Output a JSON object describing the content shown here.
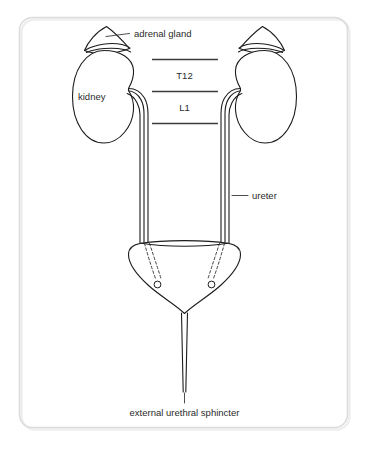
{
  "figure": {
    "background_color": "#ffffff",
    "frame_color": "#dcdcdc",
    "stroke_color": "#1c1c1c",
    "text_color": "#2b2b2b"
  },
  "labels": {
    "adrenal_gland": "adrenal gland",
    "kidney": "kidney",
    "ureter": "ureter",
    "external_urethral_sphincter": "external urethral sphincter",
    "vertebra_t12": "T12",
    "vertebra_l1": "L1"
  },
  "structures": [
    {
      "name": "adrenal-gland-left",
      "label": "adrenal gland",
      "side": "left"
    },
    {
      "name": "adrenal-gland-right",
      "label": "adrenal gland",
      "side": "right"
    },
    {
      "name": "kidney-left",
      "label": "kidney",
      "side": "left"
    },
    {
      "name": "kidney-right",
      "label": "kidney",
      "side": "right"
    },
    {
      "name": "ureter-left",
      "label": "ureter",
      "side": "left"
    },
    {
      "name": "ureter-right",
      "label": "ureter",
      "side": "right"
    },
    {
      "name": "urinary-bladder",
      "label": "bladder",
      "side": "midline"
    },
    {
      "name": "ureteric-orifice-left",
      "label": "ureteric orifice",
      "side": "left"
    },
    {
      "name": "ureteric-orifice-right",
      "label": "ureteric orifice",
      "side": "right"
    },
    {
      "name": "urethra",
      "label": "urethra",
      "side": "midline"
    },
    {
      "name": "external-urethral-sphincter",
      "label": "external urethral sphincter",
      "side": "midline"
    }
  ],
  "vertebral_levels": [
    {
      "name": "T12",
      "label": "T12"
    },
    {
      "name": "L1",
      "label": "L1"
    }
  ]
}
